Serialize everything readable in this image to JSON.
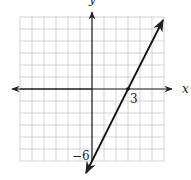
{
  "chart_data": {
    "type": "line",
    "title": "",
    "xlabel": "x",
    "ylabel": "y",
    "xlim": [
      -6,
      6
    ],
    "ylim": [
      -6,
      6
    ],
    "grid": true,
    "grid_step": 1,
    "series": [
      {
        "name": "line",
        "equation": "y = 2x - 6",
        "slope": 2,
        "intercept": -6,
        "x": [
          0,
          3,
          6
        ],
        "y": [
          -6,
          0,
          6
        ],
        "arrows": "both"
      }
    ],
    "annotations": [
      {
        "text": "3",
        "x": 3,
        "y": 0,
        "meaning": "x-intercept"
      },
      {
        "text": "−6",
        "x": 0,
        "y": -6,
        "meaning": "y-intercept"
      }
    ]
  },
  "labels": {
    "x_axis": "x",
    "y_axis": "y",
    "x_intercept": "3",
    "y_intercept": "−6"
  },
  "colors": {
    "grid": "#c8c8c8",
    "axis": "#222222",
    "line": "#111111"
  }
}
